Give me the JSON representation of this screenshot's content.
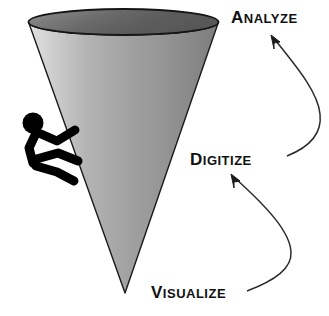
{
  "diagram": {
    "background_color": "#ffffff",
    "ink_color": "#111111",
    "cone": {
      "name": "cone-shape",
      "fill_light": "#d8d8d8",
      "fill_mid": "#9a9a9a",
      "fill_dark": "#6f6f6f",
      "rim_fill_light": "#8e8e8e",
      "rim_fill_dark": "#4a4a4a",
      "outline_color": "#1b1b1b"
    },
    "climber": {
      "name": "climbing-stick-figure",
      "color": "#000000"
    },
    "labels": [
      {
        "id": "visualize",
        "initial": "V",
        "remainder": "ISUALIZE",
        "full": "VISUALIZE",
        "order": 1
      },
      {
        "id": "digitize",
        "initial": "D",
        "remainder": "IGITIZE",
        "full": "DIGITIZE",
        "order": 2
      },
      {
        "id": "analyze",
        "initial": "A",
        "remainder": "NALYZE",
        "full": "ANALYZE",
        "order": 3
      }
    ],
    "arrows": [
      {
        "id": "visualize-to-digitize",
        "from": "VISUALIZE",
        "to": "DIGITIZE",
        "color": "#2b2b2b"
      },
      {
        "id": "digitize-to-analyze",
        "from": "DIGITIZE",
        "to": "ANALYZE",
        "color": "#2b2b2b"
      }
    ]
  }
}
